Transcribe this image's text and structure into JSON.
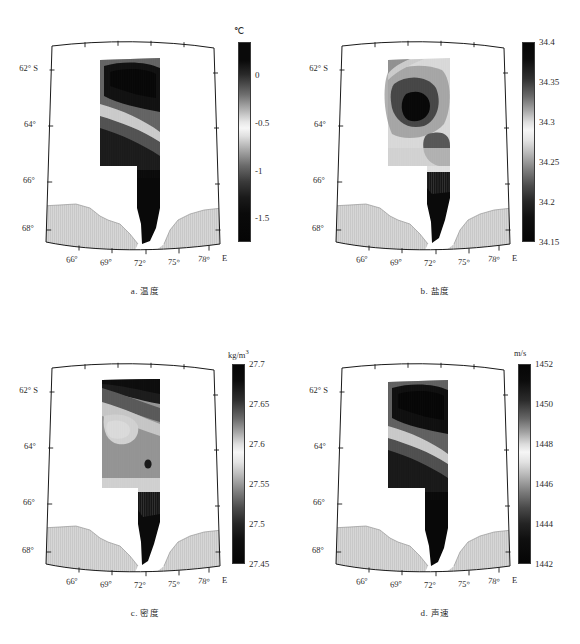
{
  "figure": {
    "type": "multi-panel-map-figure",
    "panel_count": 4,
    "projection": "conic (Antarctic sector, Prydz Bay / Cooperation Sea)",
    "land_fill_color": "#d4d4d4",
    "ocean_blank_color": "#ffffff",
    "frame_color": "#1a1a1a"
  },
  "axes": {
    "xticks": [
      "66°",
      "69°",
      "72°",
      "75°",
      "78°"
    ],
    "x_suffix": "E",
    "yticks": [
      "62°",
      "64°",
      "66°",
      "68°"
    ],
    "y_suffix": "S",
    "xlim": [
      64.0,
      80.0
    ],
    "ylim": [
      -69.5,
      -61.0
    ]
  },
  "panels": [
    {
      "id": "a",
      "caption_prefix": "a.",
      "caption_cn": "温度",
      "caption_en": "Temperature",
      "unit": "℃",
      "unit_html": "℃",
      "cbar_ticks": [
        "0",
        "-0.5",
        "-1",
        "-1.5"
      ],
      "cbar_tick_values": [
        0,
        -0.5,
        -1,
        -1.5
      ],
      "cbar_range": [
        -1.75,
        0.35
      ],
      "cbar_positions_pct": [
        16.7,
        40.5,
        64.3,
        88.1
      ]
    },
    {
      "id": "b",
      "caption_prefix": "b.",
      "caption_cn": "盐度",
      "caption_en": "Salinity",
      "unit": "",
      "unit_html": "",
      "cbar_ticks": [
        "34.4",
        "34.35",
        "34.3",
        "34.25",
        "34.2",
        "34.15"
      ],
      "cbar_tick_values": [
        34.4,
        34.35,
        34.3,
        34.25,
        34.2,
        34.15
      ],
      "cbar_range": [
        34.15,
        34.4
      ],
      "cbar_positions_pct": [
        0,
        20,
        40,
        60,
        80,
        100
      ]
    },
    {
      "id": "c",
      "caption_prefix": "c.",
      "caption_cn": "密度",
      "caption_en": "Density",
      "unit": "kg/m3",
      "unit_html": "kg/m<sup>3</sup>",
      "cbar_ticks": [
        "27.7",
        "27.65",
        "27.6",
        "27.55",
        "27.5",
        "27.45"
      ],
      "cbar_tick_values": [
        27.7,
        27.65,
        27.6,
        27.55,
        27.5,
        27.45
      ],
      "cbar_range": [
        27.45,
        27.7
      ],
      "cbar_positions_pct": [
        0,
        20,
        40,
        60,
        80,
        100
      ]
    },
    {
      "id": "d",
      "caption_prefix": "d.",
      "caption_cn": "声速",
      "caption_en": "Sound speed",
      "unit": "m/s",
      "unit_html": "m/s",
      "cbar_ticks": [
        "1452",
        "1450",
        "1448",
        "1446",
        "1444",
        "1442"
      ],
      "cbar_tick_values": [
        1452,
        1450,
        1448,
        1446,
        1444,
        1442
      ],
      "cbar_range": [
        1441.2,
        1452.4
      ],
      "cbar_positions_pct": [
        0,
        20,
        40,
        60,
        80,
        100
      ]
    }
  ],
  "chart_data": {
    "type": "heatmap",
    "title": "",
    "xlabel": "Longitude (E)",
    "ylabel": "Latitude (S)",
    "grid": false,
    "legend": "colorbar right of each panel",
    "colormap": "grayscale bone/pink-like: dark at both ends, near-white at middle",
    "panels": [
      {
        "id": "a",
        "variable": "Temperature",
        "unit": "℃",
        "vmin": -1.75,
        "vmax": 0.35,
        "tick_values": [
          0,
          -0.5,
          -1,
          -1.5
        ],
        "contour_bands": [
          {
            "label": "warmest core (NE, 62-63.5S / 71-76E)",
            "value_range": [
              -0.2,
              0.35
            ],
            "shade": "#101010"
          },
          {
            "label": "transition band",
            "value_range": [
              -0.6,
              -0.2
            ],
            "shade": "#707070"
          },
          {
            "label": "mid band",
            "value_range": [
              -0.9,
              -0.6
            ],
            "shade": "#c8c8c8"
          },
          {
            "label": "cold shelf water (S, 65-69S)",
            "value_range": [
              -1.75,
              -1.2
            ],
            "shade": "#0d0d0d"
          }
        ]
      },
      {
        "id": "b",
        "variable": "Salinity",
        "unit": "",
        "vmin": 34.15,
        "vmax": 34.4,
        "tick_values": [
          34.4,
          34.35,
          34.3,
          34.25,
          34.2,
          34.15
        ],
        "contour_bands": [
          {
            "label": "high-salinity closed core (~63.8S / 70E)",
            "value_range": [
              34.38,
              34.4
            ],
            "shade": "#0d0d0d"
          },
          {
            "label": "ring around core",
            "value_range": [
              34.33,
              34.38
            ],
            "shade": "#585858"
          },
          {
            "label": "intermediate",
            "value_range": [
              34.27,
              34.33
            ],
            "shade": "#d0d0d0"
          },
          {
            "label": "southern low-salinity tongue",
            "value_range": [
              34.15,
              34.22
            ],
            "shade": "#0d0d0d"
          }
        ]
      },
      {
        "id": "c",
        "variable": "Density (sigma-t)",
        "unit": "kg/m3",
        "vmin": 27.45,
        "vmax": 27.7,
        "tick_values": [
          27.7,
          27.65,
          27.6,
          27.55,
          27.5,
          27.45
        ],
        "contour_bands": [
          {
            "label": "dense northern band (62-63S)",
            "value_range": [
              27.66,
              27.7
            ],
            "shade": "#141414"
          },
          {
            "label": "upper-mid band",
            "value_range": [
              27.58,
              27.66
            ],
            "shade": "#8f8f8f"
          },
          {
            "label": "light lobe (64-65S / 68-72E)",
            "value_range": [
              27.52,
              27.58
            ],
            "shade": "#d9d9d9"
          },
          {
            "label": "dense southern shelf tongue",
            "value_range": [
              27.45,
              27.52
            ],
            "shade": "#101010"
          }
        ]
      },
      {
        "id": "d",
        "variable": "Sound speed",
        "unit": "m/s",
        "vmin": 1441.2,
        "vmax": 1452.4,
        "tick_values": [
          1452,
          1450,
          1448,
          1446,
          1444,
          1442
        ],
        "contour_bands": [
          {
            "label": "fast core (NE, 62-63.5S / 71-76E)",
            "value_range": [
              1450.5,
              1452.4
            ],
            "shade": "#0d0d0d"
          },
          {
            "label": "transition band",
            "value_range": [
              1448.5,
              1450.5
            ],
            "shade": "#6b6b6b"
          },
          {
            "label": "mid band",
            "value_range": [
              1446.5,
              1448.5
            ],
            "shade": "#c8c8c8"
          },
          {
            "label": "slow shelf water (S)",
            "value_range": [
              1441.2,
              1444.5
            ],
            "shade": "#0d0d0d"
          }
        ]
      }
    ]
  }
}
